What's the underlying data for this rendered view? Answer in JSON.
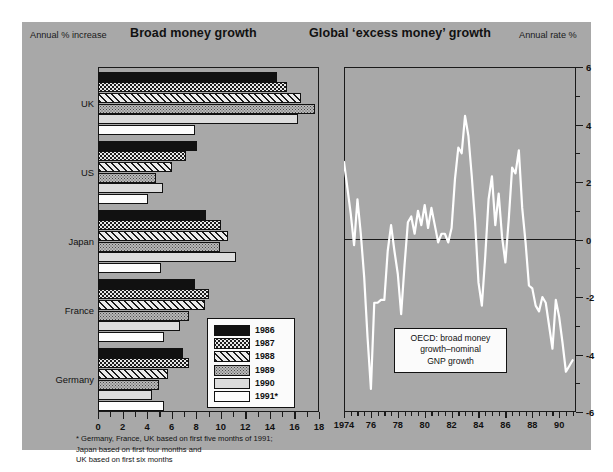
{
  "figure": {
    "background": "#a8a8a8",
    "left_panel": {
      "title": "Broad money growth",
      "axis_caption": "Annual % increase",
      "footnote_line1": "* Germany, France, UK based on first five months of 1991;",
      "footnote_line2": "Japan based on first four months and",
      "footnote_line3": "UK based on first six months"
    },
    "right_panel": {
      "title": "Global ‘excess money’ growth",
      "axis_caption": "Annual rate %",
      "annotation_line1": "OECD: broad money",
      "annotation_line2": "growth–nominal",
      "annotation_line3": "GNP growth"
    }
  },
  "legend": {
    "items": [
      {
        "label": "1986",
        "pattern": "solid-black",
        "color": "#111111"
      },
      {
        "label": "1987",
        "pattern": "checker-dots",
        "color": "#1c1c1c"
      },
      {
        "label": "1988",
        "pattern": "diagonal-hatch",
        "color": "#e9e9e9"
      },
      {
        "label": "1989",
        "pattern": "fine-dots",
        "color": "#b9b9b9"
      },
      {
        "label": "1990",
        "pattern": "light-grey",
        "color": "#dcdcdc"
      },
      {
        "label": "1991*",
        "pattern": "white",
        "color": "#fdfdfd"
      }
    ]
  },
  "chart_data": [
    {
      "type": "bar",
      "id": "broad-money-growth",
      "title": "Broad money growth",
      "orientation": "horizontal",
      "xlabel": "Annual % increase",
      "ylabel": "",
      "xlim": [
        0,
        18
      ],
      "xticks": [
        0,
        2,
        4,
        6,
        8,
        10,
        12,
        14,
        16,
        18
      ],
      "grid": false,
      "legend_position": "inside-right-lower",
      "categories": [
        "UK",
        "US",
        "Japan",
        "France",
        "Germany"
      ],
      "series": [
        {
          "name": "1986",
          "values": [
            14.6,
            8.1,
            8.8,
            7.9,
            6.9
          ]
        },
        {
          "name": "1987",
          "values": [
            15.4,
            7.2,
            10.0,
            9.0,
            7.4
          ]
        },
        {
          "name": "1988",
          "values": [
            16.5,
            6.0,
            10.6,
            8.7,
            5.7
          ]
        },
        {
          "name": "1989",
          "values": [
            17.7,
            4.7,
            9.9,
            7.4,
            5.0
          ]
        },
        {
          "name": "1990",
          "values": [
            16.3,
            5.3,
            11.2,
            6.7,
            4.4
          ]
        },
        {
          "name": "1991*",
          "values": [
            7.9,
            4.1,
            5.1,
            5.4,
            5.4
          ]
        }
      ]
    },
    {
      "type": "line",
      "id": "global-excess-money-growth",
      "title": "Global ‘excess money’ growth",
      "ylabel": "Annual rate %",
      "xlabel": "",
      "ylim": [
        -6,
        6
      ],
      "yticks": [
        -6,
        -4,
        -2,
        0,
        2,
        4,
        6
      ],
      "xlim": [
        1974,
        1991.25
      ],
      "xticks": [
        1974,
        1976,
        1978,
        1980,
        1982,
        1984,
        1986,
        1988,
        1990
      ],
      "xticklabels": [
        "1974",
        "76",
        "78",
        "80",
        "82",
        "84",
        "86",
        "88",
        "90"
      ],
      "grid": false,
      "zero_line": true,
      "line_color": "#ffffff",
      "annotation": "OECD: broad money growth-nominal GNP growth",
      "x": [
        1974.0,
        1974.25,
        1974.5,
        1974.75,
        1975.0,
        1975.25,
        1975.5,
        1975.75,
        1976.0,
        1976.25,
        1976.5,
        1976.75,
        1977.0,
        1977.25,
        1977.5,
        1977.75,
        1978.0,
        1978.25,
        1978.5,
        1978.75,
        1979.0,
        1979.25,
        1979.5,
        1979.75,
        1980.0,
        1980.25,
        1980.5,
        1980.75,
        1981.0,
        1981.25,
        1981.5,
        1981.75,
        1982.0,
        1982.25,
        1982.5,
        1982.75,
        1983.0,
        1983.25,
        1983.5,
        1983.75,
        1984.0,
        1984.25,
        1984.5,
        1984.75,
        1985.0,
        1985.25,
        1985.5,
        1985.75,
        1986.0,
        1986.25,
        1986.5,
        1986.75,
        1987.0,
        1987.25,
        1987.5,
        1987.75,
        1988.0,
        1988.25,
        1988.5,
        1988.75,
        1989.0,
        1989.25,
        1989.5,
        1989.75,
        1990.0,
        1990.25,
        1990.5,
        1990.75,
        1991.0
      ],
      "y": [
        2.7,
        1.8,
        0.9,
        -0.2,
        1.4,
        0.2,
        -1.3,
        -3.4,
        -5.2,
        -2.2,
        -2.2,
        -2.1,
        -2.1,
        -0.4,
        0.5,
        -0.4,
        -1.2,
        -2.6,
        -0.9,
        0.6,
        0.8,
        0.2,
        1.0,
        0.5,
        1.2,
        0.4,
        1.1,
        0.5,
        -0.1,
        0.2,
        0.2,
        -0.1,
        0.4,
        2.1,
        3.2,
        3.0,
        4.3,
        3.6,
        2.2,
        0.6,
        -1.5,
        -2.3,
        -0.6,
        1.4,
        2.2,
        0.5,
        1.6,
        0.1,
        -0.8,
        0.7,
        2.5,
        2.3,
        3.1,
        1.1,
        -0.1,
        -1.6,
        -1.7,
        -2.3,
        -2.5,
        -2.0,
        -2.2,
        -3.0,
        -3.8,
        -2.1,
        -2.7,
        -3.6,
        -4.6,
        -4.4,
        -4.2
      ]
    }
  ]
}
